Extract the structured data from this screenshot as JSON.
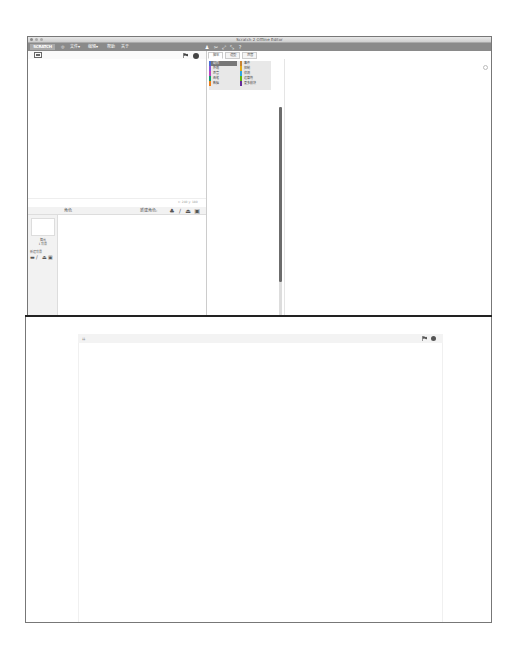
{
  "window": {
    "title": "Scratch 2 Offline Editor"
  },
  "menubar": {
    "logo": "SCRATCH",
    "items": [
      {
        "label": "文件▾"
      },
      {
        "label": "编辑▾"
      },
      {
        "label": "帮助"
      },
      {
        "label": "关于"
      }
    ],
    "tools": [
      "duplicate-icon",
      "delete-icon",
      "grow-icon",
      "shrink-icon",
      "help-icon"
    ]
  },
  "stage": {
    "coords": "x: 240  y: 180"
  },
  "tabs": [
    {
      "label": "脚本",
      "active": true
    },
    {
      "label": "造型",
      "active": false
    },
    {
      "label": "声音",
      "active": false
    }
  ],
  "categories": [
    {
      "label": "动作",
      "color": "#4a6cd4",
      "active": true
    },
    {
      "label": "外观",
      "color": "#8a55d7"
    },
    {
      "label": "声音",
      "color": "#bb42c3"
    },
    {
      "label": "画笔",
      "color": "#0e9a6c"
    },
    {
      "label": "数据",
      "color": "#ee7d16"
    },
    {
      "label": "事件",
      "color": "#c88330"
    },
    {
      "label": "控制",
      "color": "#e1a91a"
    },
    {
      "label": "侦测",
      "color": "#2ca5e2"
    },
    {
      "label": "运算符",
      "color": "#5cb712"
    },
    {
      "label": "更多模块",
      "color": "#632d99"
    }
  ],
  "sprites": {
    "title": "角色",
    "new_sprite_label": "新建角色:",
    "stage_label": "舞台",
    "stage_backdrops": "1 背景",
    "new_backdrop_label": "新建背景"
  },
  "colors": {
    "menubar": "#8a8a8a",
    "separator": "#222222"
  }
}
